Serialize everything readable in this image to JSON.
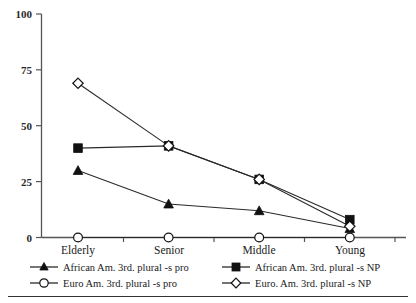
{
  "chart_data": {
    "type": "line",
    "title": "",
    "subtitle": "",
    "xlabel": "",
    "ylabel": "",
    "categories": [
      "Elderly",
      "Senior",
      "Middle",
      "Young"
    ],
    "ylim": [
      0,
      100
    ],
    "yticks": [
      0,
      25,
      50,
      75,
      100
    ],
    "ytick_labels": [
      "0",
      "25",
      "50",
      "75",
      "100"
    ],
    "grid": false,
    "legend_position": "bottom",
    "series": [
      {
        "name": "African Am. 3rd. plural -s pro",
        "marker": "triangle-filled",
        "values": [
          30,
          15,
          12,
          4
        ]
      },
      {
        "name": "African Am. 3rd. plural -s NP",
        "marker": "square-filled",
        "values": [
          40,
          41,
          26,
          8
        ]
      },
      {
        "name": "Euro Am. 3rd. plural -s pro",
        "marker": "circle-open",
        "values": [
          0,
          0,
          0,
          0
        ]
      },
      {
        "name": "Euro. Am. 3rd. plural -s NP",
        "marker": "diamond-open",
        "values": [
          69,
          41,
          26,
          5
        ]
      }
    ],
    "colors": {
      "line": "#2a2a2a",
      "marker_fill": "#111111",
      "marker_open_fill": "#ffffff",
      "axis": "#555555",
      "text": "#1a1a1a",
      "background": "#ffffff"
    }
  },
  "legend": {
    "entries": [
      {
        "label": "African Am. 3rd. plural -s pro",
        "marker": "triangle-filled"
      },
      {
        "label": "African Am. 3rd. plural -s NP",
        "marker": "square-filled"
      },
      {
        "label": "Euro Am. 3rd. plural -s pro",
        "marker": "circle-open"
      },
      {
        "label": "Euro. Am. 3rd. plural -s NP",
        "marker": "diamond-open"
      }
    ]
  }
}
